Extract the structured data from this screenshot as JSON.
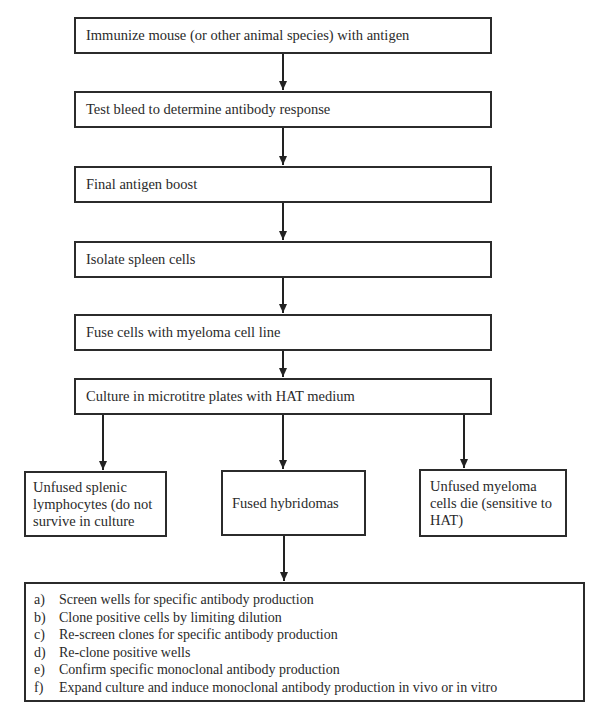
{
  "steps": [
    {
      "label": "Immunize mouse (or other animal species) with antigen"
    },
    {
      "label": "Test bleed to determine antibody response"
    },
    {
      "label": "Final antigen boost"
    },
    {
      "label": "Isolate spleen cells"
    },
    {
      "label": "Fuse cells with myeloma cell line"
    },
    {
      "label": "Culture in microtitre plates with HAT medium"
    }
  ],
  "branches": {
    "left": {
      "label": "Unfused splenic lymphocytes (do not survive in culture"
    },
    "center": {
      "label": "Fused hybridomas"
    },
    "right": {
      "label": "Unfused myeloma cells die (sensitive to HAT)"
    }
  },
  "final_steps": [
    {
      "marker": "a)",
      "label": "Screen wells for specific antibody production"
    },
    {
      "marker": "b)",
      "label": "Clone positive cells by limiting dilution"
    },
    {
      "marker": "c)",
      "label": "Re-screen clones for specific antibody production"
    },
    {
      "marker": "d)",
      "label": "Re-clone positive wells"
    },
    {
      "marker": "e)",
      "label": "Confirm specific monoclonal antibody production"
    },
    {
      "marker": "f)",
      "label": "Expand culture and induce monoclonal antibody production in vivo or in vitro"
    }
  ]
}
